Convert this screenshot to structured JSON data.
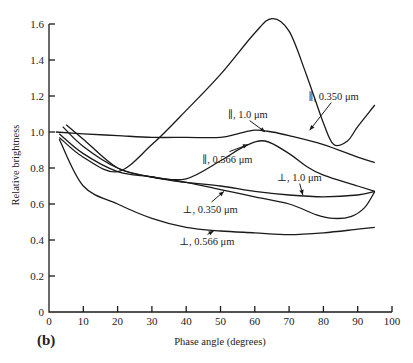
{
  "chart_data": {
    "type": "line",
    "title": "",
    "panel_label": "(b)",
    "xlabel": "Phase angle (degrees)",
    "ylabel": "Relative brightness",
    "xlim": [
      0,
      100
    ],
    "ylim": [
      0,
      1.6
    ],
    "x_ticks": [
      0,
      10,
      20,
      30,
      40,
      50,
      60,
      70,
      80,
      90,
      100
    ],
    "y_ticks": [
      0,
      0.2,
      0.4,
      0.6,
      0.8,
      1.0,
      1.2,
      1.4,
      1.6
    ],
    "y_tick_labels": [
      "0",
      "0.2",
      "0.4",
      "0.6",
      "0.8",
      "1.0",
      "1.2",
      "1.4",
      "1.6"
    ],
    "grid": false,
    "legend": "inline labels with arrows",
    "series": [
      {
        "name": "∥, 0.350 μm",
        "x": [
          3,
          10,
          20,
          30,
          40,
          50,
          60,
          65,
          70,
          75,
          80,
          83,
          87,
          90,
          95
        ],
        "y": [
          0.97,
          0.86,
          0.78,
          0.93,
          1.12,
          1.32,
          1.55,
          1.63,
          1.56,
          1.32,
          1.05,
          0.93,
          0.95,
          1.03,
          1.15
        ]
      },
      {
        "name": "∥, 1.0 μm",
        "x": [
          2,
          10,
          20,
          30,
          40,
          50,
          55,
          60,
          65,
          70,
          80,
          90,
          95
        ],
        "y": [
          1.0,
          0.99,
          0.98,
          0.97,
          0.97,
          0.97,
          0.99,
          1.01,
          1.0,
          0.98,
          0.93,
          0.86,
          0.83
        ]
      },
      {
        "name": "∥, 0.566 μm",
        "x": [
          4,
          10,
          20,
          30,
          40,
          50,
          57,
          63,
          70,
          75,
          80,
          90,
          95
        ],
        "y": [
          1.03,
          0.92,
          0.8,
          0.75,
          0.74,
          0.84,
          0.92,
          0.95,
          0.88,
          0.81,
          0.76,
          0.7,
          0.67
        ]
      },
      {
        "name": "⊥, 1.0 μm",
        "x": [
          5,
          10,
          20,
          30,
          40,
          50,
          60,
          70,
          80,
          90,
          95
        ],
        "y": [
          1.04,
          0.96,
          0.8,
          0.75,
          0.72,
          0.7,
          0.67,
          0.65,
          0.64,
          0.65,
          0.67
        ]
      },
      {
        "name": "⊥, 0.350 μm",
        "x": [
          3,
          10,
          20,
          30,
          40,
          50,
          60,
          70,
          78,
          83,
          88,
          92,
          95
        ],
        "y": [
          0.99,
          0.88,
          0.78,
          0.75,
          0.72,
          0.68,
          0.64,
          0.6,
          0.54,
          0.52,
          0.53,
          0.58,
          0.67
        ]
      },
      {
        "name": "⊥, 0.566 μm",
        "x": [
          3,
          10,
          20,
          30,
          40,
          50,
          60,
          70,
          80,
          90,
          95
        ],
        "y": [
          0.96,
          0.7,
          0.6,
          0.52,
          0.47,
          0.45,
          0.44,
          0.43,
          0.44,
          0.46,
          0.47
        ]
      }
    ],
    "annotations": [
      {
        "text": "∥, 0.350 μm",
        "x": 83,
        "y": 1.18,
        "arrow_to": [
          76,
          1.01
        ]
      },
      {
        "text": "∥, 1.0 μm",
        "x": 58,
        "y": 1.08,
        "arrow_to": [
          63,
          1.0
        ]
      },
      {
        "text": "∥, 0.566 μm",
        "x": 52,
        "y": 0.83,
        "arrow_to": [
          58,
          0.93
        ]
      },
      {
        "text": "⊥, 1.0 μm",
        "x": 73,
        "y": 0.73,
        "arrow_to": [
          74,
          0.65
        ]
      },
      {
        "text": "⊥, 0.350 μm",
        "x": 47,
        "y": 0.55,
        "arrow_to": [
          51,
          0.67
        ]
      },
      {
        "text": "⊥, 0.566 μm",
        "x": 46,
        "y": 0.37,
        "arrow_to": [
          48,
          0.45
        ]
      }
    ]
  },
  "caption": {
    "partial_text": "Figure — (caption cut off at bottom edge)"
  }
}
